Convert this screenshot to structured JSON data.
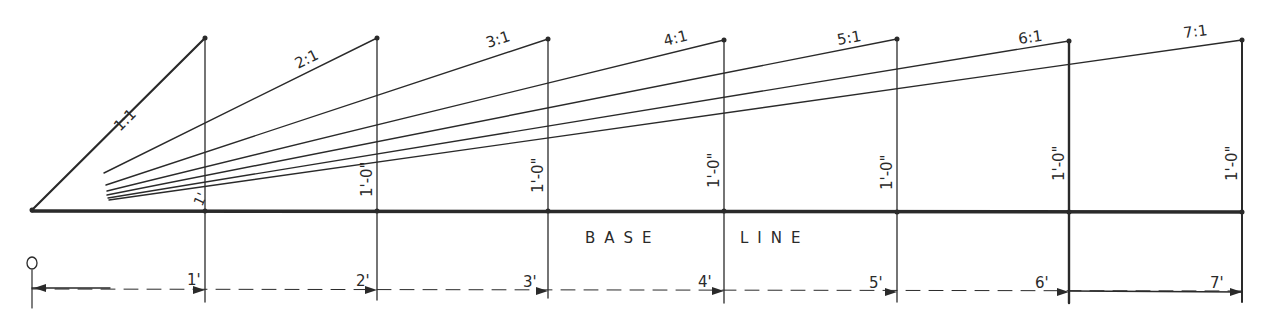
{
  "base_line_label": "BASE LINE",
  "base_line_words": [
    "BASE",
    "LINE"
  ],
  "origin_label": "0",
  "ratios": [
    {
      "label": "1:1",
      "run_ft": 1
    },
    {
      "label": "2:1",
      "run_ft": 2
    },
    {
      "label": "3:1",
      "run_ft": 3
    },
    {
      "label": "4:1",
      "run_ft": 4
    },
    {
      "label": "5:1",
      "run_ft": 5
    },
    {
      "label": "6:1",
      "run_ft": 6
    },
    {
      "label": "7:1",
      "run_ft": 7
    }
  ],
  "rise_label": "1'-0\"",
  "rise_labels": [
    "1'",
    "1'-0\"",
    "1'-0\"",
    "1'-0\"",
    "1'-0\"",
    "1'-0\"",
    "1'-0\""
  ],
  "dimension_labels": [
    "1'",
    "2'",
    "3'",
    "4'",
    "5'",
    "6'",
    "7'"
  ],
  "colors": {
    "ink": "#2a2a2a",
    "paper": "#ffffff"
  }
}
